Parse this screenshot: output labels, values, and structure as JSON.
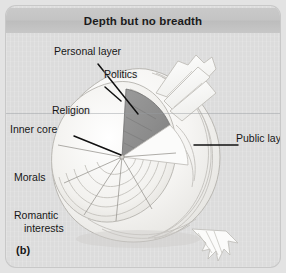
{
  "figure": {
    "panel_label": "(b)",
    "title": "Depth but no breadth",
    "accent_wedge_color": "#8f8f8f",
    "panel_bg_color": "#dcdcdc",
    "titlebar_color": "#c4c4c4",
    "onion_color": "#f3f3f1",
    "leader_color": "#1a1a1a"
  },
  "labels": {
    "personal_layer": "Personal layer",
    "politics": "Politics",
    "religion": "Religion",
    "inner_core": "Inner core",
    "morals": "Morals",
    "romantic_line1": "Romantic",
    "romantic_line2": "interests",
    "public_layer": "Public layer"
  },
  "diagram": {
    "type": "onion-model",
    "layers_outer_to_inner": [
      "Public layer",
      "Personal layer",
      "Inner core"
    ],
    "topic_wedges": [
      "Politics",
      "Religion",
      "Morals",
      "Romantic interests"
    ]
  }
}
